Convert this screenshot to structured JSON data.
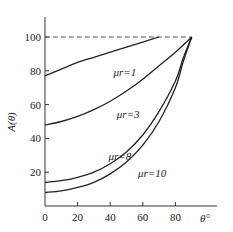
{
  "chart_data": {
    "type": "line",
    "title": "",
    "xlabel": "θ°",
    "ylabel": "A(θ)",
    "xlim": [
      0,
      95
    ],
    "ylim": [
      0,
      110
    ],
    "xticks": [
      0,
      20,
      40,
      60,
      80
    ],
    "yticks": [
      20,
      40,
      60,
      80,
      100
    ],
    "grid": false,
    "reference_line": {
      "y": 100,
      "style": "dashed",
      "x_range": [
        0,
        90
      ]
    },
    "series": [
      {
        "name": "μr=1",
        "x": [
          0,
          10,
          20,
          30,
          40,
          50,
          60,
          70
        ],
        "y": [
          77,
          81,
          85,
          88,
          91,
          94,
          97,
          100
        ]
      },
      {
        "name": "μr=3",
        "x": [
          0,
          10,
          20,
          30,
          40,
          50,
          60,
          70,
          80,
          90
        ],
        "y": [
          48,
          50,
          53,
          57,
          62,
          68,
          75,
          83,
          91,
          100
        ]
      },
      {
        "name": "μr=8",
        "x": [
          0,
          10,
          20,
          30,
          40,
          50,
          60,
          70,
          80,
          85,
          90
        ],
        "y": [
          14,
          15,
          17,
          20,
          25,
          32,
          42,
          56,
          74,
          88,
          100
        ]
      },
      {
        "name": "μr=10",
        "x": [
          0,
          10,
          20,
          30,
          40,
          50,
          60,
          70,
          80,
          85,
          90
        ],
        "y": [
          8,
          9,
          11,
          14,
          19,
          26,
          36,
          50,
          70,
          86,
          100
        ]
      }
    ],
    "annotations": [
      {
        "text": "μr=1",
        "x": 42,
        "y": 77
      },
      {
        "text": "μr=3",
        "x": 44,
        "y": 52
      },
      {
        "text": "μr=8",
        "x": 39,
        "y": 27
      },
      {
        "text": "μr=10",
        "x": 57,
        "y": 17
      }
    ]
  }
}
